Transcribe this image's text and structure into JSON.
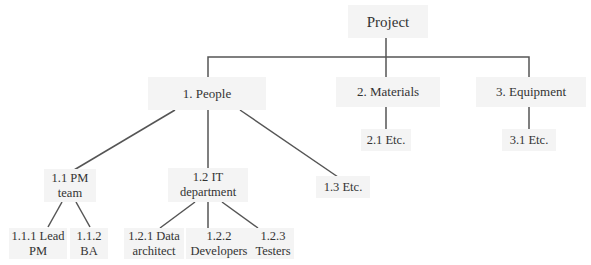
{
  "diagram": {
    "type": "work-breakdown-structure",
    "line_color": "#555555",
    "box_color": "#f4f4f4",
    "text_color": "#333333",
    "root": {
      "label": "Project"
    },
    "level1": [
      {
        "label": "1. People"
      },
      {
        "label": "2. Materials"
      },
      {
        "label": "3. Equipment"
      }
    ],
    "people_children": [
      {
        "label": "1.1 PM\nteam"
      },
      {
        "label": "1.2 IT\ndepartment"
      },
      {
        "label": "1.3 Etc."
      }
    ],
    "pm_team_children": [
      {
        "label": "1.1.1 Lead\nPM"
      },
      {
        "label": "1.1.2\nBA"
      }
    ],
    "it_children": [
      {
        "label": "1.2.1 Data\narchitect"
      },
      {
        "label": "1.2.2\nDevelopers"
      },
      {
        "label": "1.2.3\nTesters"
      }
    ],
    "materials_children": [
      {
        "label": "2.1 Etc."
      }
    ],
    "equipment_children": [
      {
        "label": "3.1 Etc."
      }
    ]
  }
}
